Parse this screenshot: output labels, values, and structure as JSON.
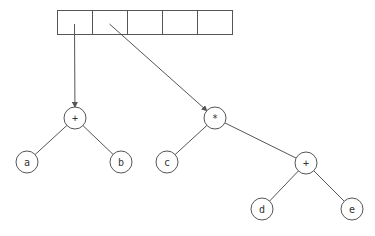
{
  "diagram": {
    "array": {
      "x": 57,
      "y": 10,
      "cell_width": 35,
      "height": 24,
      "cells": [
        "",
        "",
        "",
        "",
        ""
      ]
    },
    "pointers": [
      {
        "from_cell": 0,
        "to_node": "plus1"
      },
      {
        "from_cell": 1,
        "to_node": "times"
      }
    ],
    "nodes": [
      {
        "id": "plus1",
        "label": "+",
        "cx": 75,
        "cy": 118
      },
      {
        "id": "a",
        "label": "a",
        "cx": 27,
        "cy": 162
      },
      {
        "id": "b",
        "label": "b",
        "cx": 121,
        "cy": 162
      },
      {
        "id": "times",
        "label": "*",
        "cx": 215,
        "cy": 118
      },
      {
        "id": "c",
        "label": "c",
        "cx": 167,
        "cy": 162
      },
      {
        "id": "plus2",
        "label": "+",
        "cx": 306,
        "cy": 163
      },
      {
        "id": "d",
        "label": "d",
        "cx": 262,
        "cy": 209
      },
      {
        "id": "e",
        "label": "e",
        "cx": 352,
        "cy": 209
      }
    ],
    "edges": [
      {
        "from": "plus1",
        "to": "a"
      },
      {
        "from": "plus1",
        "to": "b"
      },
      {
        "from": "times",
        "to": "c"
      },
      {
        "from": "times",
        "to": "plus2"
      },
      {
        "from": "plus2",
        "to": "d"
      },
      {
        "from": "plus2",
        "to": "e"
      }
    ],
    "node_radius": 11,
    "stroke_color": "#555555"
  }
}
